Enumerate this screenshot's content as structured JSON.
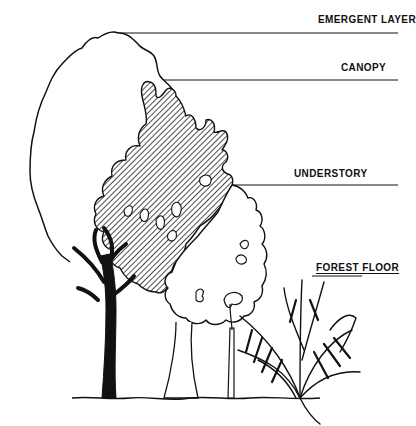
{
  "diagram": {
    "type": "labeled-illustration",
    "colors": {
      "ink": "#111111",
      "background": "#ffffff",
      "hatch": "#222222"
    },
    "layers": [
      {
        "id": "emergent",
        "label": "EMERGENT LAYER",
        "leader_y": 33
      },
      {
        "id": "canopy",
        "label": "CANOPY",
        "leader_y": 80
      },
      {
        "id": "understory",
        "label": "UNDERSTORY",
        "leader_y": 185
      },
      {
        "id": "forest_floor",
        "label": "FOREST FLOOR",
        "leader_y": 276
      }
    ]
  }
}
